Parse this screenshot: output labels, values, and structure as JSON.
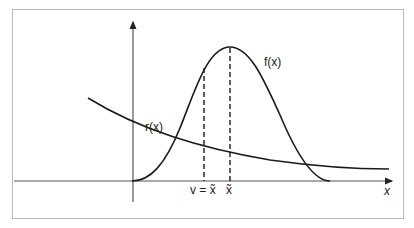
{
  "diagram": {
    "curves": [
      {
        "id": "f",
        "label": "f(x)",
        "shape": "bell",
        "peak_x_label": "x̃"
      },
      {
        "id": "r",
        "label": "r(x)",
        "shape": "decreasing"
      }
    ],
    "axes": {
      "x_label": "x",
      "has_y_axis_arrow": true,
      "has_x_axis_arrow": true
    },
    "markers": [
      {
        "label": "v = x̃",
        "style": "dashed"
      },
      {
        "label": "x̃",
        "style": "dashed"
      }
    ],
    "colors": {
      "line": "#1a1a1a",
      "axis": "#555555",
      "frame": "#b8b8b8"
    }
  }
}
